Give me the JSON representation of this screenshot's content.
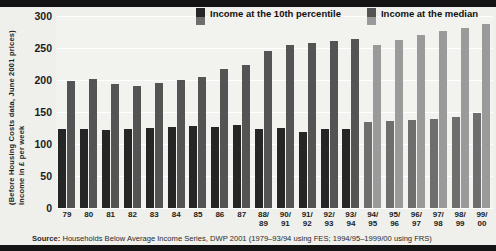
{
  "chart_data": {
    "type": "bar",
    "title": "",
    "xlabel": "",
    "ylabel": "Income in £ per week (Before Housing Costs data, June 2001 prices)",
    "ylabel_line1": "Income in £ per week",
    "ylabel_line2": "(Before Housing Costs data, June 2001 prices)",
    "ylim": [
      0,
      300
    ],
    "yticks": [
      0,
      50,
      100,
      150,
      200,
      250,
      300
    ],
    "ytick_labels": [
      "0",
      "50",
      "100",
      "150",
      "200",
      "250",
      "300"
    ],
    "grid": true,
    "legend_position": "top-right",
    "categories": [
      "79",
      "80",
      "81",
      "82",
      "83",
      "84",
      "85",
      "86",
      "87",
      "88/\n89",
      "90/\n91",
      "91/\n92",
      "92/\n93",
      "93/\n94",
      "94/\n95",
      "95/\n96",
      "96/\n97",
      "97/\n98",
      "98/\n99",
      "99/\n00"
    ],
    "category_labels": [
      {
        "top": "79",
        "bottom": ""
      },
      {
        "top": "80",
        "bottom": ""
      },
      {
        "top": "81",
        "bottom": ""
      },
      {
        "top": "82",
        "bottom": ""
      },
      {
        "top": "83",
        "bottom": ""
      },
      {
        "top": "84",
        "bottom": ""
      },
      {
        "top": "85",
        "bottom": ""
      },
      {
        "top": "86",
        "bottom": ""
      },
      {
        "top": "87",
        "bottom": ""
      },
      {
        "top": "88/",
        "bottom": "89"
      },
      {
        "top": "90/",
        "bottom": "91"
      },
      {
        "top": "91/",
        "bottom": "92"
      },
      {
        "top": "92/",
        "bottom": "93"
      },
      {
        "top": "93/",
        "bottom": "94"
      },
      {
        "top": "94/",
        "bottom": "95"
      },
      {
        "top": "95/",
        "bottom": "96"
      },
      {
        "top": "96/",
        "bottom": "97"
      },
      {
        "top": "97/",
        "bottom": "98"
      },
      {
        "top": "98/",
        "bottom": "99"
      },
      {
        "top": "99/",
        "bottom": "00"
      }
    ],
    "series": [
      {
        "name": "Income at the 10th percentile",
        "color_fes": "#262626",
        "color_frs": "#6e6e6e",
        "values": [
          123,
          124,
          122,
          124,
          125,
          126,
          128,
          127,
          129,
          124,
          125,
          119,
          123,
          124,
          135,
          136,
          138,
          139,
          142,
          148
        ]
      },
      {
        "name": "Income at the median",
        "color_fes": "#545454",
        "color_frs": "#9a9a9a",
        "values": [
          199,
          202,
          194,
          191,
          196,
          200,
          205,
          217,
          224,
          246,
          254,
          258,
          261,
          264,
          255,
          263,
          271,
          276,
          281,
          288
        ]
      }
    ],
    "break_after_index": 13,
    "break_note": "Series 1979–93/94 use FES; 1994/95–1999/00 use FRS",
    "colors": {
      "plot_background": "#f2f2ef",
      "page_background": "#efefec",
      "gridline": "#ffffff",
      "band": "#141414",
      "text": "#1c1c1c"
    }
  },
  "legend": {
    "items": [
      {
        "label": "Income at the 10th percentile",
        "swatch_top": "#262626",
        "swatch_bottom": "#6e6e6e",
        "icon": "legend-swatch-icon"
      },
      {
        "label": "Income at the median",
        "swatch_top": "#545454",
        "swatch_bottom": "#9a9a9a",
        "icon": "legend-swatch-icon"
      }
    ]
  },
  "source": {
    "prefix": "Source:",
    "text": " Households Below Average Income Series, DWP 2001 (1979–93/94 using FES; 1994/95–1999/00 using FRS)"
  }
}
